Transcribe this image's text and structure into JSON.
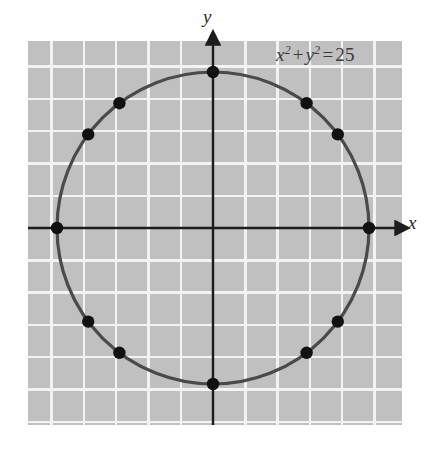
{
  "figure": {
    "axis_labels": {
      "x": "x",
      "y": "y"
    },
    "equation": {
      "full_text": "x² + y² = 25",
      "lhs_var1": "x",
      "lhs_exp1": "2",
      "operator": "+",
      "lhs_var2": "y",
      "lhs_exp2": "2",
      "equals": "=",
      "rhs": "25"
    },
    "colors": {
      "plot_background": "#c0c0c0",
      "grid_line": "#f2f2f2",
      "curve": "#4a4a4a",
      "axis": "#1c1c1c",
      "point": "#111111",
      "page_background": "#ffffff",
      "text": "#333333"
    }
  },
  "chart_data": {
    "type": "scatter",
    "xlabel": "x",
    "ylabel": "y",
    "xlim": [
      -5.75,
      5.85
    ],
    "ylim": [
      -5.8,
      5.8
    ],
    "grid": true,
    "grid_spacing": 1,
    "legend": "none",
    "curve": {
      "name": "x² + y² = 25",
      "shape": "circle",
      "center": [
        0,
        0
      ],
      "radius": 5
    },
    "points": [
      {
        "x": 5,
        "y": 0
      },
      {
        "x": 4,
        "y": 3
      },
      {
        "x": 3,
        "y": 4
      },
      {
        "x": 0,
        "y": 5
      },
      {
        "x": -3,
        "y": 4
      },
      {
        "x": -4,
        "y": 3
      },
      {
        "x": -5,
        "y": 0
      },
      {
        "x": -4,
        "y": -3
      },
      {
        "x": -3,
        "y": -4
      },
      {
        "x": 0,
        "y": -5
      },
      {
        "x": 3,
        "y": -4
      },
      {
        "x": 4,
        "y": -3
      }
    ]
  },
  "geometry": {
    "plot_rect": {
      "x": 28,
      "y": 41,
      "width": 374,
      "height": 384
    },
    "origin": {
      "x": 213,
      "y": 228
    },
    "unit_px": 31.2,
    "radius_px": 156,
    "point_radius_px": 6.2,
    "grid_step_px": 32.3
  }
}
